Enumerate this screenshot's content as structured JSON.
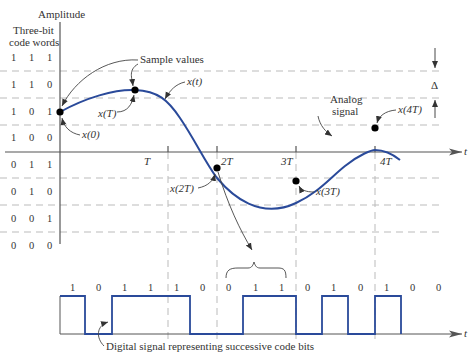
{
  "axis": {
    "y_label": "Amplitude",
    "x_label": "t",
    "code_header_line1": "Three-bit",
    "code_header_line2": "code words",
    "time_ticks": [
      "T",
      "2T",
      "3T",
      "4T"
    ]
  },
  "code_words": [
    [
      "1",
      "1",
      "1"
    ],
    [
      "1",
      "1",
      "0"
    ],
    [
      "1",
      "0",
      "1"
    ],
    [
      "1",
      "0",
      "0"
    ],
    [
      "0",
      "1",
      "1"
    ],
    [
      "0",
      "1",
      "0"
    ],
    [
      "0",
      "0",
      "1"
    ],
    [
      "0",
      "0",
      "0"
    ]
  ],
  "annotations": {
    "sample_values": "Sample values",
    "x_t": "x(t)",
    "x_0": "x(0)",
    "x_T": "x(T)",
    "x_2T": "x(2T)",
    "x_3T": "x(3T)",
    "x_4T": "x(4T)",
    "analog_line1": "Analog",
    "analog_line2": "signal",
    "delta": "Δ",
    "digital_caption": "Digital signal representing successive code bits"
  },
  "digital_bits": [
    "1",
    "0",
    "1",
    "1",
    "1",
    "0",
    "0",
    "1",
    "1",
    "0",
    "1",
    "0",
    "1",
    "0",
    "0"
  ],
  "colors": {
    "signal": "#2a4a9a",
    "axis": "#555555",
    "grid": "#bbbbbb",
    "text": "#333333"
  }
}
